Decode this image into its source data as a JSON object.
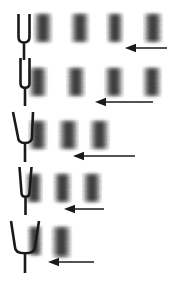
{
  "figure": {
    "width": 188,
    "height": 286,
    "background_color": "#ffffff",
    "ink_color": "#1a1a1a",
    "fringe_color": "#4a4a4a"
  },
  "rows": [
    {
      "index": 1,
      "label": "row-1",
      "fork": {
        "name": "tuning-fork-narrow-upright",
        "prong_gap": 11,
        "tilt": "upright",
        "x": 14,
        "y": 14,
        "width": 20,
        "height": 46
      },
      "fringe_count": 4,
      "fringe_spacing": 37,
      "fringes": [
        {
          "x": 33,
          "y": 13,
          "w": 20,
          "h": 30
        },
        {
          "x": 70,
          "y": 13,
          "w": 20,
          "h": 30
        },
        {
          "x": 106,
          "y": 13,
          "w": 18,
          "h": 30
        },
        {
          "x": 143,
          "y": 13,
          "w": 20,
          "h": 30
        }
      ],
      "arrow": {
        "name": "arrow-left-short",
        "x": 125,
        "y": 42,
        "length": 42,
        "direction": "left"
      }
    },
    {
      "index": 2,
      "label": "row-2",
      "fork": {
        "name": "tuning-fork-narrow-upright",
        "prong_gap": 9,
        "tilt": "upright",
        "x": 16,
        "y": 58,
        "width": 18,
        "height": 48
      },
      "fringe_count": 4,
      "fringe_spacing": 38,
      "fringes": [
        {
          "x": 28,
          "y": 67,
          "w": 20,
          "h": 30
        },
        {
          "x": 66,
          "y": 67,
          "w": 20,
          "h": 30
        },
        {
          "x": 104,
          "y": 67,
          "w": 20,
          "h": 30
        },
        {
          "x": 142,
          "y": 67,
          "w": 20,
          "h": 30
        }
      ],
      "arrow": {
        "name": "arrow-left-medium",
        "x": 95,
        "y": 96,
        "length": 58,
        "direction": "left"
      }
    },
    {
      "index": 3,
      "label": "row-3",
      "fork": {
        "name": "tuning-fork-tilted",
        "prong_gap": 14,
        "tilt": "left-splayed",
        "x": 13,
        "y": 112,
        "width": 24,
        "height": 50
      },
      "fringe_count": 3,
      "fringe_spacing": 30,
      "fringes": [
        {
          "x": 28,
          "y": 120,
          "w": 20,
          "h": 30
        },
        {
          "x": 58,
          "y": 120,
          "w": 21,
          "h": 30
        },
        {
          "x": 89,
          "y": 120,
          "w": 21,
          "h": 30
        }
      ],
      "arrow": {
        "name": "arrow-left-long",
        "x": 73,
        "y": 150,
        "length": 62,
        "direction": "left"
      }
    },
    {
      "index": 4,
      "label": "row-4",
      "fork": {
        "name": "tuning-fork-tapered",
        "prong_gap": 8,
        "tilt": "tapered",
        "x": 17,
        "y": 167,
        "width": 17,
        "height": 48
      },
      "fringe_count": 3,
      "fringe_spacing": 28,
      "fringes": [
        {
          "x": 25,
          "y": 173,
          "w": 18,
          "h": 30
        },
        {
          "x": 53,
          "y": 173,
          "w": 19,
          "h": 30
        },
        {
          "x": 82,
          "y": 173,
          "w": 20,
          "h": 30
        }
      ],
      "arrow": {
        "name": "arrow-left-medium",
        "x": 64,
        "y": 203,
        "length": 40,
        "direction": "left"
      }
    },
    {
      "index": 5,
      "label": "row-5",
      "fork": {
        "name": "tuning-fork-wide-v",
        "prong_gap": 20,
        "tilt": "wide-splayed",
        "x": 11,
        "y": 221,
        "width": 28,
        "height": 52
      },
      "fringe_count": 2,
      "fringe_spacing": 24,
      "fringes": [
        {
          "x": 27,
          "y": 226,
          "w": 16,
          "h": 30
        },
        {
          "x": 51,
          "y": 226,
          "w": 21,
          "h": 32
        }
      ],
      "arrow": {
        "name": "arrow-left-short",
        "x": 48,
        "y": 256,
        "length": 46,
        "direction": "left"
      }
    }
  ]
}
